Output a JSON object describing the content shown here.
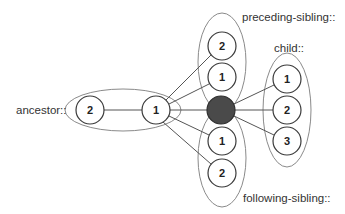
{
  "diagram": {
    "colors": {
      "context_fill": "#4a4a4a",
      "node_stroke": "#3a3a3a",
      "group_stroke": "#8a8a8a",
      "edge": "#555555",
      "text": "#333333"
    },
    "context_node": {
      "id": "self",
      "label": ""
    },
    "groups": [
      {
        "id": "ancestor",
        "label": "ancestor::",
        "nodes": [
          {
            "id": "ancestor-1",
            "label": "1"
          },
          {
            "id": "ancestor-2",
            "label": "2"
          }
        ]
      },
      {
        "id": "preceding-sibling",
        "label": "preceding-sibling::",
        "nodes": [
          {
            "id": "preceding-sibling-1",
            "label": "1"
          },
          {
            "id": "preceding-sibling-2",
            "label": "2"
          }
        ]
      },
      {
        "id": "child",
        "label": "child::",
        "nodes": [
          {
            "id": "child-1",
            "label": "1"
          },
          {
            "id": "child-2",
            "label": "2"
          },
          {
            "id": "child-3",
            "label": "3"
          }
        ]
      },
      {
        "id": "following-sibling",
        "label": "following-sibling::",
        "nodes": [
          {
            "id": "following-sibling-1",
            "label": "1"
          },
          {
            "id": "following-sibling-2",
            "label": "2"
          }
        ]
      }
    ],
    "edges": [
      {
        "from": "ancestor-2",
        "to": "ancestor-1"
      },
      {
        "from": "ancestor-1",
        "to": "self"
      },
      {
        "from": "ancestor-1",
        "to": "preceding-sibling-2"
      },
      {
        "from": "ancestor-1",
        "to": "preceding-sibling-1"
      },
      {
        "from": "ancestor-1",
        "to": "following-sibling-1"
      },
      {
        "from": "ancestor-1",
        "to": "following-sibling-2"
      },
      {
        "from": "self",
        "to": "child-1"
      },
      {
        "from": "self",
        "to": "child-2"
      },
      {
        "from": "self",
        "to": "child-3"
      }
    ]
  }
}
